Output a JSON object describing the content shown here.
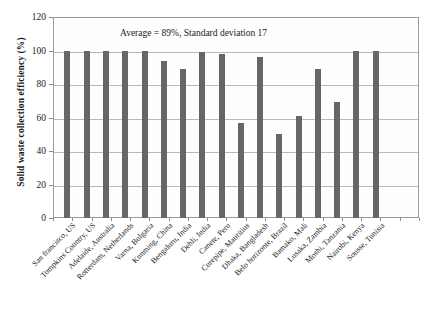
{
  "chart_data": {
    "type": "bar",
    "title": "",
    "subtitle": "",
    "xlabel": "",
    "ylabel": "Solid waste collection efficiency (%)",
    "ylim": [
      0,
      120
    ],
    "ytick_step": 20,
    "yticks": [
      0,
      20,
      40,
      60,
      80,
      100,
      120
    ],
    "grid": true,
    "legend": false,
    "legend_position": "none",
    "bar_color": "#666666",
    "annotations": [
      {
        "text": "Average = 89%, Standard deviation 17",
        "x_frac": 0.3,
        "y_value": 112
      }
    ],
    "categories": [
      "San francisco, US",
      "Tompkins Country, US",
      "Adelaide, Australia",
      "Rotterdam, Netherlands",
      "Varna, Bulgaria",
      "Kunming, China",
      "Bengaluru, India",
      "Dehli, India",
      "Canete, Peru",
      "Curepipe, Mauritius",
      "Dhaka, Bangladesh",
      "Belo horizonte, Brazil",
      "Bamako, Mali",
      "Lusaka, Zambia",
      "Moshi, Tanzania",
      "Nairobi, Kenya",
      "Sousse, Tunisia"
    ],
    "values": [
      100,
      100,
      100,
      100,
      100,
      94,
      89,
      99,
      98,
      57,
      96,
      50,
      61,
      89,
      69,
      100,
      100
    ],
    "series": [
      {
        "name": "Solid waste collection efficiency (%)",
        "values": [
          100,
          100,
          100,
          100,
          100,
          94,
          89,
          99,
          98,
          57,
          96,
          50,
          61,
          89,
          69,
          100,
          100
        ]
      }
    ]
  },
  "axis": {
    "y_title": "Solid waste collection efficiency (%)",
    "y_tick_labels": [
      "120",
      "100",
      "80",
      "60",
      "40",
      "20",
      "0"
    ]
  }
}
